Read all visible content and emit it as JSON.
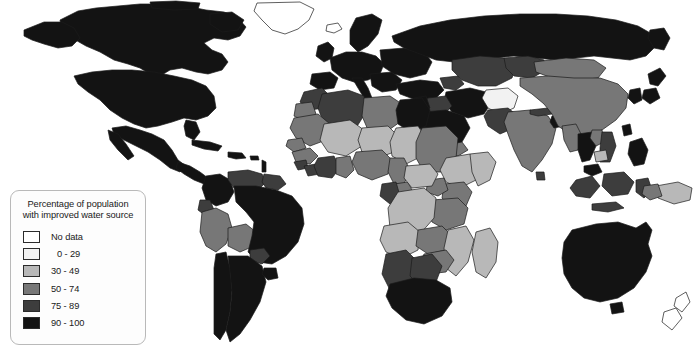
{
  "figure": {
    "type": "choropleth-world-map",
    "title": "Percentage of population with improved water source"
  },
  "legend": {
    "title_line1": "Percentage of population",
    "title_line2": "with improved water source",
    "entries": [
      {
        "label": "No data",
        "color": "#ffffff",
        "range": null
      },
      {
        "label": "0 - 29",
        "color": "#f2f2f2",
        "range": [
          0,
          29
        ]
      },
      {
        "label": "30 - 49",
        "color": "#b8b8b8",
        "range": [
          30,
          49
        ]
      },
      {
        "label": "50 - 74",
        "color": "#777777",
        "range": [
          50,
          74
        ]
      },
      {
        "label": "75 - 89",
        "color": "#3d3d3d",
        "range": [
          75,
          89
        ]
      },
      {
        "label": "90 - 100",
        "color": "#131313",
        "range": [
          90,
          100
        ]
      }
    ]
  },
  "map": {
    "ocean_color": "#ffffff",
    "border_color": "#1b1b1b",
    "regions": [
      {
        "name": "greenland",
        "class": "No data"
      },
      {
        "name": "canada",
        "class": "90 - 100"
      },
      {
        "name": "united-states",
        "class": "90 - 100"
      },
      {
        "name": "mexico",
        "class": "90 - 100"
      },
      {
        "name": "central-america",
        "class": "90 - 100"
      },
      {
        "name": "caribbean",
        "class": "90 - 100"
      },
      {
        "name": "colombia",
        "class": "90 - 100"
      },
      {
        "name": "venezuela",
        "class": "75 - 89"
      },
      {
        "name": "guyanas",
        "class": "75 - 89"
      },
      {
        "name": "ecuador",
        "class": "75 - 89"
      },
      {
        "name": "peru",
        "class": "50 - 74"
      },
      {
        "name": "bolivia",
        "class": "50 - 74"
      },
      {
        "name": "brazil",
        "class": "90 - 100"
      },
      {
        "name": "chile",
        "class": "90 - 100"
      },
      {
        "name": "argentina",
        "class": "90 - 100"
      },
      {
        "name": "paraguay",
        "class": "75 - 89"
      },
      {
        "name": "uruguay",
        "class": "90 - 100"
      },
      {
        "name": "western-europe",
        "class": "90 - 100"
      },
      {
        "name": "eastern-europe",
        "class": "90 - 100"
      },
      {
        "name": "russia",
        "class": "90 - 100"
      },
      {
        "name": "turkey",
        "class": "90 - 100"
      },
      {
        "name": "caucasus",
        "class": "75 - 89"
      },
      {
        "name": "central-asia",
        "class": "75 - 89"
      },
      {
        "name": "mongolia",
        "class": "50 - 74"
      },
      {
        "name": "china",
        "class": "50 - 74"
      },
      {
        "name": "japan",
        "class": "90 - 100"
      },
      {
        "name": "korea",
        "class": "90 - 100"
      },
      {
        "name": "india",
        "class": "50 - 74"
      },
      {
        "name": "pakistan",
        "class": "75 - 89"
      },
      {
        "name": "afghanistan",
        "class": "0 - 29"
      },
      {
        "name": "iran",
        "class": "90 - 100"
      },
      {
        "name": "iraq",
        "class": "75 - 89"
      },
      {
        "name": "saudi-arabia",
        "class": "90 - 100"
      },
      {
        "name": "yemen",
        "class": "50 - 74"
      },
      {
        "name": "nepal",
        "class": "75 - 89"
      },
      {
        "name": "bangladesh",
        "class": "90 - 100"
      },
      {
        "name": "myanmar",
        "class": "50 - 74"
      },
      {
        "name": "thailand",
        "class": "90 - 100"
      },
      {
        "name": "laos",
        "class": "50 - 74"
      },
      {
        "name": "vietnam",
        "class": "75 - 89"
      },
      {
        "name": "cambodia",
        "class": "30 - 49"
      },
      {
        "name": "malaysia",
        "class": "90 - 100"
      },
      {
        "name": "indonesia",
        "class": "75 - 89"
      },
      {
        "name": "philippines",
        "class": "90 - 100"
      },
      {
        "name": "papua-new-guinea",
        "class": "30 - 49"
      },
      {
        "name": "australia",
        "class": "90 - 100"
      },
      {
        "name": "new-zealand",
        "class": "No data"
      },
      {
        "name": "morocco",
        "class": "75 - 89"
      },
      {
        "name": "algeria",
        "class": "75 - 89"
      },
      {
        "name": "libya",
        "class": "50 - 74"
      },
      {
        "name": "egypt",
        "class": "90 - 100"
      },
      {
        "name": "sudan",
        "class": "50 - 74"
      },
      {
        "name": "mauritania",
        "class": "50 - 74"
      },
      {
        "name": "mali",
        "class": "30 - 49"
      },
      {
        "name": "niger",
        "class": "30 - 49"
      },
      {
        "name": "chad",
        "class": "30 - 49"
      },
      {
        "name": "senegal",
        "class": "50 - 74"
      },
      {
        "name": "guinea",
        "class": "50 - 74"
      },
      {
        "name": "sierra-leone",
        "class": "75 - 89"
      },
      {
        "name": "liberia",
        "class": "75 - 89"
      },
      {
        "name": "ivory-coast",
        "class": "75 - 89"
      },
      {
        "name": "ghana",
        "class": "50 - 74"
      },
      {
        "name": "nigeria",
        "class": "50 - 74"
      },
      {
        "name": "ethiopia",
        "class": "30 - 49"
      },
      {
        "name": "somalia",
        "class": "30 - 49"
      },
      {
        "name": "kenya",
        "class": "50 - 74"
      },
      {
        "name": "uganda",
        "class": "50 - 74"
      },
      {
        "name": "tanzania",
        "class": "50 - 74"
      },
      {
        "name": "dr-congo",
        "class": "30 - 49"
      },
      {
        "name": "congo",
        "class": "50 - 74"
      },
      {
        "name": "gabon",
        "class": "75 - 89"
      },
      {
        "name": "angola",
        "class": "30 - 49"
      },
      {
        "name": "zambia",
        "class": "50 - 74"
      },
      {
        "name": "mozambique",
        "class": "30 - 49"
      },
      {
        "name": "madagascar",
        "class": "30 - 49"
      },
      {
        "name": "namibia",
        "class": "75 - 89"
      },
      {
        "name": "botswana",
        "class": "75 - 89"
      },
      {
        "name": "south-africa",
        "class": "90 - 100"
      },
      {
        "name": "zimbabwe",
        "class": "50 - 74"
      }
    ]
  }
}
